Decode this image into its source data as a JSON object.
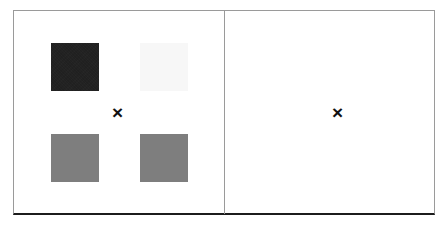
{
  "figure": {
    "background_color": "#ffffff",
    "frame": {
      "border_color": "#9a9a9a",
      "bottom_border_color": "#1c1c1c"
    },
    "divider_color": "#9a9a9a"
  },
  "panels": {
    "left": {
      "marker": "×",
      "swatches": [
        {
          "name": "top-left",
          "color": "#232323",
          "label": "dark"
        },
        {
          "name": "top-right",
          "color": "#f7f7f7",
          "label": "near-white"
        },
        {
          "name": "bottom-left",
          "color": "#7e7e7e",
          "label": "mid-gray"
        },
        {
          "name": "bottom-right",
          "color": "#7e7e7e",
          "label": "mid-gray"
        }
      ]
    },
    "right": {
      "marker": "×",
      "swatches": []
    }
  }
}
